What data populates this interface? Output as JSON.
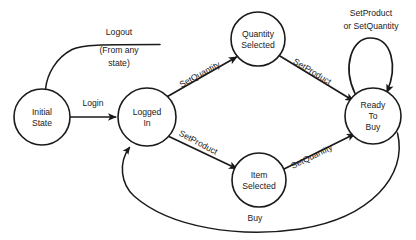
{
  "diagram": {
    "type": "state-machine-diagram",
    "title": "",
    "background_color": "#ffffff",
    "stroke_color": "#1a1a1a",
    "states": [
      {
        "id": "initial-state",
        "lines": [
          "Initial",
          "State"
        ],
        "cx": 42,
        "cy": 117,
        "r": 28
      },
      {
        "id": "logged-in",
        "lines": [
          "Logged",
          "In"
        ],
        "cx": 147,
        "cy": 117,
        "r": 29
      },
      {
        "id": "quantity-selected",
        "lines": [
          "Quantity",
          "Selected"
        ],
        "cx": 258,
        "cy": 39,
        "r": 27
      },
      {
        "id": "item-selected",
        "lines": [
          "Item",
          "Selected"
        ],
        "cx": 259,
        "cy": 180,
        "r": 27
      },
      {
        "id": "ready-to-buy",
        "lines": [
          "Ready",
          "To",
          "Buy"
        ],
        "cx": 373,
        "cy": 116,
        "r": 28
      }
    ],
    "transitions": [
      {
        "id": "logout",
        "from": "any-state",
        "to": "initial-state",
        "label_lines": [
          "Logout",
          "(From any",
          "state)"
        ],
        "label_x": 119,
        "label_y": 33
      },
      {
        "id": "login",
        "from": "initial-state",
        "to": "logged-in",
        "label_lines": [
          "Login"
        ],
        "label_x": 93,
        "label_y": 104
      },
      {
        "id": "set-quantity-logged-in",
        "from": "logged-in",
        "to": "quantity-selected",
        "label_lines": [
          "SetQuantity"
        ],
        "label_x": 200,
        "label_y": 75,
        "rotation": -29
      },
      {
        "id": "set-product-quantity-selected",
        "from": "quantity-selected",
        "to": "ready-to-buy",
        "label_lines": [
          "SetProduct"
        ],
        "label_x": 312,
        "label_y": 72,
        "rotation": 31
      },
      {
        "id": "set-product-logged-in",
        "from": "logged-in",
        "to": "item-selected",
        "label_lines": [
          "SetProduct"
        ],
        "label_x": 198,
        "label_y": 143,
        "rotation": 28
      },
      {
        "id": "set-quantity-item-selected",
        "from": "item-selected",
        "to": "ready-to-buy",
        "label_lines": [
          "SetQuantity"
        ],
        "label_x": 312,
        "label_y": 157,
        "rotation": -26
      },
      {
        "id": "self-loop-ready-to-buy",
        "from": "ready-to-buy",
        "to": "ready-to-buy",
        "label_lines": [
          "SetProduct",
          "or SetQuantity"
        ],
        "label_x": 371,
        "label_y": 14
      },
      {
        "id": "buy",
        "from": "ready-to-buy",
        "to": "logged-in",
        "label_lines": [
          "Buy"
        ],
        "label_x": 255,
        "label_y": 219
      }
    ]
  }
}
